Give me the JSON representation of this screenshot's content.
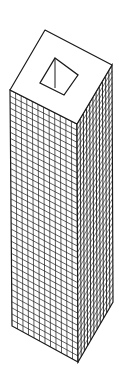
{
  "figure": {
    "width": 119,
    "height": 386,
    "background": "#ffffff",
    "stroke": "#1a1a1a",
    "roof": {
      "top": [
        45,
        30
      ],
      "right": [
        112,
        65
      ],
      "front": [
        77,
        124
      ],
      "left": [
        10,
        90
      ]
    },
    "roof_opening": {
      "top": [
        55,
        58
      ],
      "right": [
        78,
        75
      ],
      "bottom": [
        64,
        95
      ],
      "left": [
        40,
        83
      ],
      "inner_edge": [
        [
          55,
          59
        ],
        [
          55,
          88
        ]
      ]
    },
    "base": {
      "left": [
        12,
        326
      ],
      "front": [
        78,
        362
      ],
      "right": [
        113,
        302
      ]
    },
    "left_face_grid": {
      "columns": 12,
      "rows": 39
    },
    "right_face_grid": {
      "columns": 11,
      "rows": 39
    }
  }
}
